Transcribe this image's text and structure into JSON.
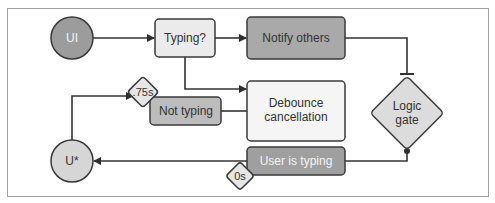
{
  "diagram": {
    "nodes": {
      "ui": {
        "label": "UI",
        "shape": "circle",
        "fill": "#9c9c9c",
        "text_color": "#f2f2f2"
      },
      "typing": {
        "label": "Typing?",
        "shape": "rounded-rect",
        "fill": "#ebebeb"
      },
      "notify": {
        "label": "Notify others",
        "shape": "rounded-rect",
        "fill": "#a9a9a9"
      },
      "debounce": {
        "line1": "Debounce",
        "line2": "cancellation",
        "shape": "rounded-rect",
        "fill": "#f5f5f5"
      },
      "not_typing": {
        "label": "Not typing",
        "shape": "rounded-rect",
        "fill": "#bcbcbc"
      },
      "delay_75": {
        "label": ".75s",
        "shape": "diamond",
        "fill": "#e6e6e6"
      },
      "logic_gate": {
        "line1": "Logic",
        "line2": "gate",
        "shape": "diamond",
        "fill": "#dcdcdc"
      },
      "user_typing": {
        "label": "User is typing",
        "shape": "rounded-rect",
        "fill": "#9f9f9f",
        "text_color": "#f2f2f2"
      },
      "delay_0": {
        "label": "0s",
        "shape": "diamond",
        "fill": "#e6e6e6"
      },
      "u_star": {
        "label": "U*",
        "shape": "circle",
        "fill": "#d6d6d6"
      }
    },
    "edges": [
      {
        "from": "UI",
        "to": "Typing?",
        "type": "arrow"
      },
      {
        "from": "Typing?",
        "to": "Notify others",
        "type": "arrow"
      },
      {
        "from": "Typing?",
        "to": "Debounce cancellation",
        "type": "arrow"
      },
      {
        "from": "Notify others",
        "to": "Logic gate",
        "type": "inhibit"
      },
      {
        "from": "Logic gate",
        "to": "User is typing",
        "type": "dot-connector"
      },
      {
        "from": "User is typing",
        "to": "U*",
        "type": "arrow",
        "delay": "0s"
      },
      {
        "from": "U*",
        "to": "Not typing",
        "type": "arrow",
        "delay": ".75s"
      },
      {
        "from": "Not typing",
        "to": "Debounce cancellation",
        "type": "line"
      }
    ],
    "colors": {
      "stroke": "#3a3a3a",
      "frame": "#9a9a9a",
      "background": "#ffffff"
    }
  }
}
